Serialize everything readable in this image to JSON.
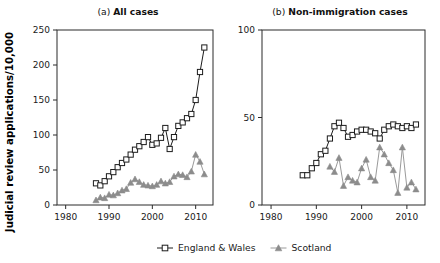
{
  "figure": {
    "ylabel": "Judicial review applications/10,000",
    "legend": {
      "position": "bottom-center",
      "entries": [
        {
          "label": "England & Wales",
          "marker": "open-square",
          "color": "#1c1c1c"
        },
        {
          "label": "Scotland",
          "marker": "filled-triangle",
          "color": "#8c8c8c"
        }
      ]
    }
  },
  "chart_data": [
    {
      "type": "line",
      "panel": "a",
      "title_prefix": "(a)",
      "title": "All cases",
      "xlabel": "",
      "ylabel": "Judicial review applications/10,000",
      "xlim": [
        1978,
        2014
      ],
      "ylim": [
        0,
        250
      ],
      "xticks": [
        1980,
        1990,
        2000,
        2010
      ],
      "yticks": [
        0,
        50,
        100,
        150,
        200,
        250
      ],
      "grid": false,
      "legend": [
        "England & Wales",
        "Scotland"
      ],
      "x": [
        1987,
        1988,
        1989,
        1990,
        1991,
        1992,
        1993,
        1994,
        1995,
        1996,
        1997,
        1998,
        1999,
        2000,
        2001,
        2002,
        2003,
        2004,
        2005,
        2006,
        2007,
        2008,
        2009,
        2010,
        2011,
        2012
      ],
      "series": [
        {
          "name": "England & Wales",
          "marker": "open-square",
          "color": "#1c1c1c",
          "values": [
            31,
            28,
            34,
            41,
            47,
            54,
            60,
            65,
            72,
            79,
            84,
            90,
            97,
            86,
            88,
            96,
            110,
            80,
            97,
            113,
            118,
            124,
            130,
            150,
            190,
            225
          ]
        },
        {
          "name": "Scotland",
          "marker": "filled-triangle",
          "color": "#8c8c8c",
          "values": [
            7,
            11,
            10,
            15,
            14,
            17,
            21,
            23,
            32,
            37,
            33,
            29,
            28,
            27,
            29,
            34,
            31,
            33,
            41,
            44,
            43,
            40,
            48,
            72,
            62,
            44
          ]
        }
      ]
    },
    {
      "type": "line",
      "panel": "b",
      "title_prefix": "(b)",
      "title": "Non-immigration cases",
      "xlabel": "",
      "ylabel": "",
      "xlim": [
        1978,
        2014
      ],
      "ylim": [
        0,
        100
      ],
      "xticks": [
        1980,
        1990,
        2000,
        2010
      ],
      "yticks": [
        0,
        50,
        100
      ],
      "grid": false,
      "legend": [
        "England & Wales",
        "Scotland"
      ],
      "x": [
        1987,
        1988,
        1989,
        1990,
        1991,
        1992,
        1993,
        1994,
        1995,
        1996,
        1997,
        1998,
        1999,
        2000,
        2001,
        2002,
        2003,
        2004,
        2005,
        2006,
        2007,
        2008,
        2009,
        2010,
        2011,
        2012
      ],
      "series": [
        {
          "name": "England & Wales",
          "marker": "open-square",
          "color": "#1c1c1c",
          "values": [
            17,
            17,
            21,
            24,
            29,
            31,
            38,
            45,
            47,
            44,
            39,
            40,
            42,
            43,
            43,
            42,
            41,
            38,
            43,
            45,
            46,
            45,
            44,
            45,
            44,
            46
          ]
        },
        {
          "name": "Scotland",
          "marker": "filled-triangle",
          "color": "#8c8c8c",
          "values": [
            null,
            null,
            null,
            null,
            null,
            null,
            22,
            19,
            27,
            11,
            16,
            14,
            13,
            21,
            26,
            16,
            14,
            33,
            29,
            24,
            20,
            7,
            33,
            10,
            13,
            9
          ]
        }
      ]
    }
  ]
}
